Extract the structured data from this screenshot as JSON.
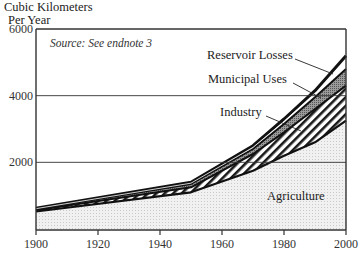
{
  "chart_data": {
    "type": "area",
    "title": "",
    "ylabel": "Cubic Kilometers Per Year",
    "ylabel_line1": "Cubic Kilometers",
    "ylabel_line2": "Per Year",
    "xlabel": "",
    "source_note": "Source: See endnote 3",
    "x": [
      1900,
      1950,
      1970,
      1980,
      1990,
      2000
    ],
    "xticks": [
      "1900",
      "1920",
      "1940",
      "1960",
      "1980",
      "2000"
    ],
    "yticks": [
      "2000",
      "4000",
      "6000"
    ],
    "ylim": [
      0,
      6000
    ],
    "xlim": [
      1900,
      2000
    ],
    "grid": "horizontal at 2000 and 4000",
    "stacked": true,
    "series": [
      {
        "name": "Agriculture",
        "values": [
          525,
          1100,
          1750,
          2200,
          2600,
          3250
        ]
      },
      {
        "name": "Industry",
        "values": [
          40,
          150,
          500,
          700,
          1000,
          1050
        ]
      },
      {
        "name": "Municipal Uses",
        "values": [
          35,
          100,
          150,
          250,
          350,
          500
        ]
      },
      {
        "name": "Reservoir Losses",
        "values": [
          20,
          50,
          100,
          150,
          200,
          400
        ]
      }
    ]
  }
}
